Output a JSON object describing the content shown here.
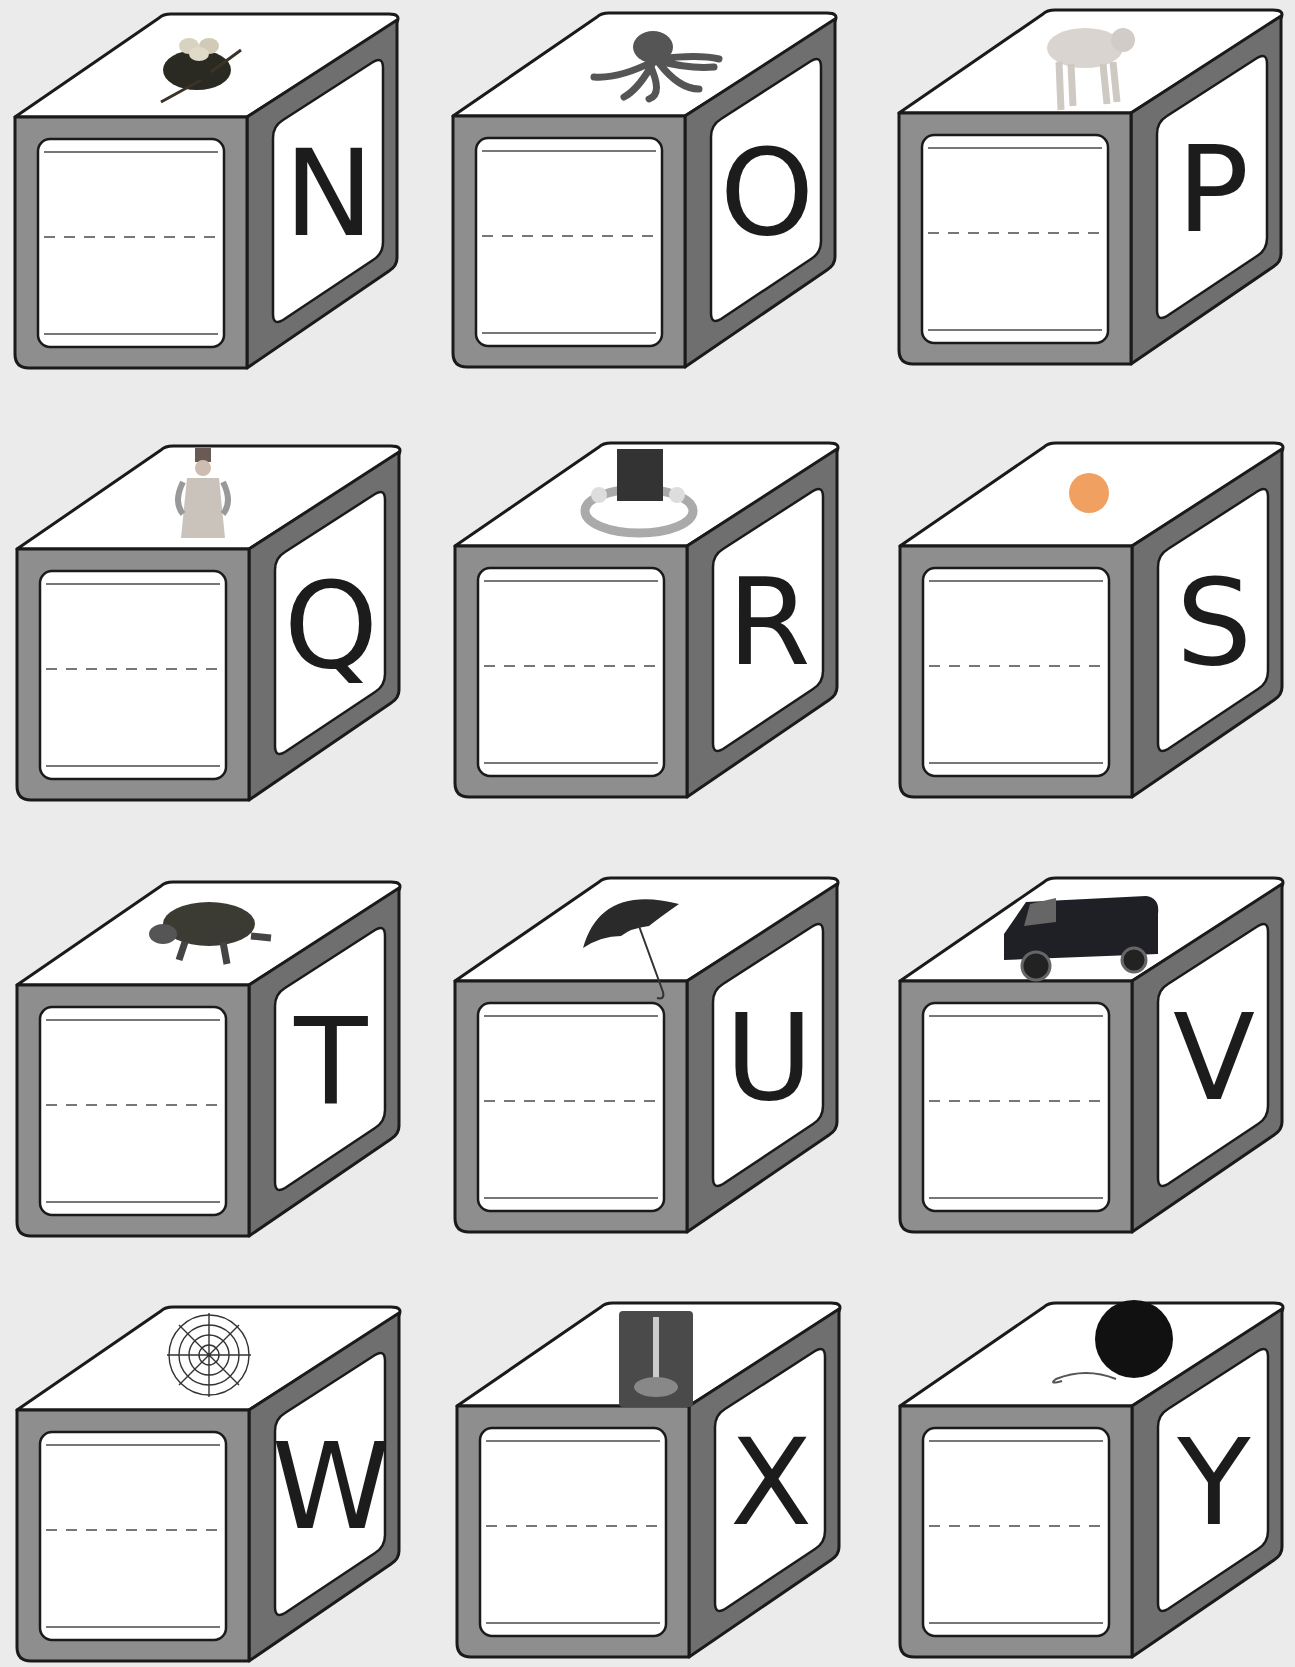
{
  "worksheet": {
    "colors": {
      "background": "#ebebeb",
      "front_frame": "#8e8e8e",
      "side_frame": "#6f6f6f",
      "face": "#ffffff",
      "outline": "#1a1a1a",
      "guide_line": "#777777"
    },
    "blocks": [
      {
        "letter": "N",
        "picture": "bird nest with eggs",
        "icon": "nest-icon"
      },
      {
        "letter": "O",
        "picture": "octopus",
        "icon": "octopus-icon"
      },
      {
        "letter": "P",
        "picture": "pig",
        "icon": "pig-icon"
      },
      {
        "letter": "Q",
        "picture": "queen",
        "icon": "queen-icon"
      },
      {
        "letter": "R",
        "picture": "ring",
        "icon": "ring-icon"
      },
      {
        "letter": "S",
        "picture": "sun",
        "icon": "sun-icon"
      },
      {
        "letter": "T",
        "picture": "turtle",
        "icon": "turtle-icon"
      },
      {
        "letter": "U",
        "picture": "umbrella",
        "icon": "umbrella-icon"
      },
      {
        "letter": "V",
        "picture": "van",
        "icon": "van-icon"
      },
      {
        "letter": "W",
        "picture": "spider web",
        "icon": "web-icon"
      },
      {
        "letter": "X",
        "picture": "x-ray",
        "icon": "xray-icon"
      },
      {
        "letter": "Y",
        "picture": "yo-yo",
        "icon": "yoyo-icon"
      }
    ]
  }
}
